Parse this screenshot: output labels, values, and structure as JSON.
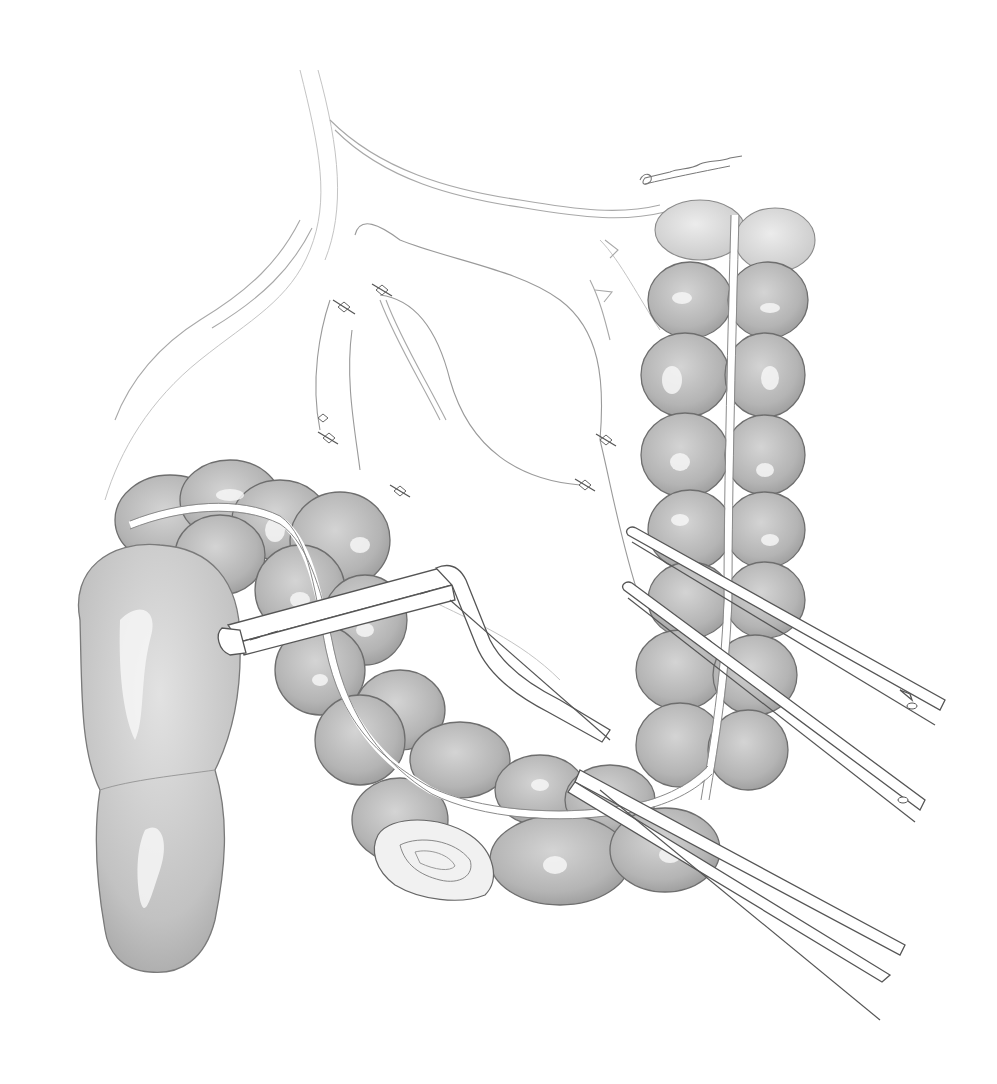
{
  "illustration": {
    "type": "surgical pencil illustration",
    "subject": "colon resection with linear stapler and intestinal clamps",
    "background_color": "#ffffff",
    "tone_colors": {
      "bowel_fill": "#b8b8b8",
      "bowel_outline": "#6e6e6e",
      "highlight": "#f6f6f6",
      "instrument_fill": "#ffffff",
      "instrument_outline": "#555555"
    },
    "elements": [
      {
        "name": "mesentery",
        "description": "mesentery with vessels and suture ties"
      },
      {
        "name": "descending-colon",
        "description": "vertical haustrated colon on right"
      },
      {
        "name": "transverse-colon",
        "description": "curving haustrated colon segment"
      },
      {
        "name": "cecum",
        "description": "large bulbous bowel on left"
      },
      {
        "name": "linear-stapler",
        "description": "stapler clamped across bowel"
      },
      {
        "name": "intestinal-clamps",
        "description": "two long clamps on right and one lower"
      },
      {
        "name": "bowel-stump",
        "description": "rolled closed stump at bottom"
      },
      {
        "name": "artist-signature",
        "description": "handwritten signature, top right"
      }
    ],
    "suture_ties_count": 7
  }
}
